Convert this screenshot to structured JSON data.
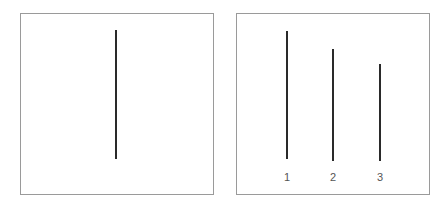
{
  "figure": {
    "type": "line-length comparison (Asch conformity stimulus)",
    "left_panel": {
      "role": "reference",
      "line": {
        "label": "",
        "length_rel": 1.0
      }
    },
    "right_panel": {
      "role": "comparison",
      "lines": [
        {
          "label": "1",
          "length_rel": 1.0
        },
        {
          "label": "2",
          "length_rel": 0.87
        },
        {
          "label": "3",
          "length_rel": 0.76
        }
      ]
    }
  },
  "colors": {
    "border": "#9a9a9a",
    "line": "#2a2a2a",
    "label": "#555555",
    "background": "#ffffff"
  }
}
